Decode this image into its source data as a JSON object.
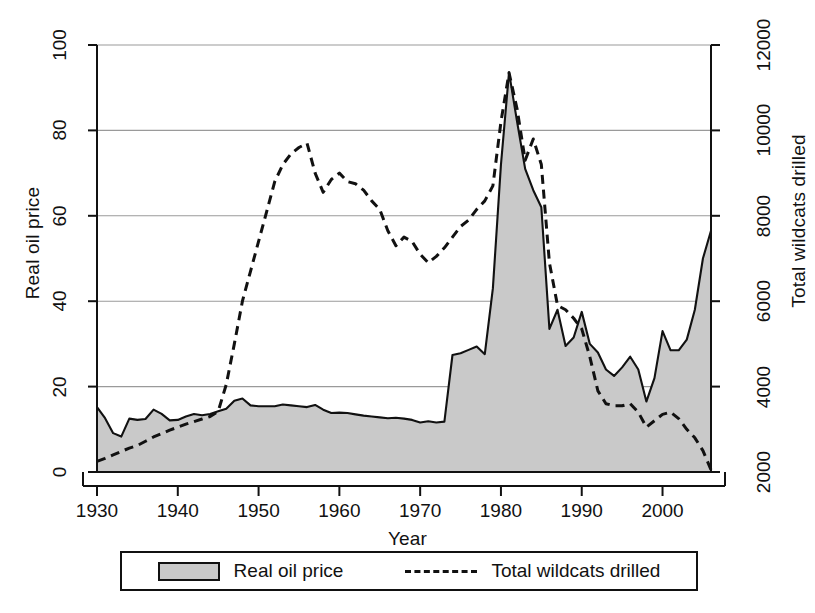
{
  "chart_data": {
    "type": "area",
    "title": "",
    "xlabel": "Year",
    "ylabel": "Real oil price",
    "ylabel_secondary": "Total wildcats drilled",
    "xlim": [
      1930,
      2006
    ],
    "ylim": [
      0,
      100
    ],
    "ylim_secondary": [
      2000,
      12000
    ],
    "xticks": [
      1930,
      1940,
      1950,
      1960,
      1970,
      1980,
      1990,
      2000
    ],
    "yticks": [
      0,
      20,
      40,
      60,
      80,
      100
    ],
    "yticks_secondary": [
      2000,
      4000,
      6000,
      8000,
      10000,
      12000
    ],
    "grid": true,
    "grid_axis": "y",
    "legend_position": "below-plot",
    "x": [
      1930,
      1931,
      1932,
      1933,
      1934,
      1935,
      1936,
      1937,
      1938,
      1939,
      1940,
      1941,
      1942,
      1943,
      1944,
      1945,
      1946,
      1947,
      1948,
      1949,
      1950,
      1951,
      1952,
      1953,
      1954,
      1955,
      1956,
      1957,
      1958,
      1959,
      1960,
      1961,
      1962,
      1963,
      1964,
      1965,
      1966,
      1967,
      1968,
      1969,
      1970,
      1971,
      1972,
      1973,
      1974,
      1975,
      1976,
      1977,
      1978,
      1979,
      1980,
      1981,
      1982,
      1983,
      1984,
      1985,
      1986,
      1987,
      1988,
      1989,
      1990,
      1991,
      1992,
      1993,
      1994,
      1995,
      1996,
      1997,
      1998,
      1999,
      2000,
      2001,
      2002,
      2003,
      2004,
      2005,
      2006
    ],
    "series": [
      {
        "name": "Real oil price",
        "axis": "left",
        "style": "filled-area",
        "fill_color": "#c9c9c9",
        "line_color": "#111111",
        "values": [
          15.2,
          12.6,
          9.1,
          8.3,
          12.5,
          12.2,
          12.4,
          14.6,
          13.6,
          12.1,
          12.2,
          13.0,
          13.6,
          13.3,
          13.6,
          14.2,
          14.8,
          16.7,
          17.2,
          15.6,
          15.4,
          15.4,
          15.4,
          15.8,
          15.6,
          15.4,
          15.2,
          15.7,
          14.6,
          13.8,
          13.9,
          13.8,
          13.5,
          13.2,
          13.0,
          12.8,
          12.6,
          12.7,
          12.5,
          12.2,
          11.6,
          11.9,
          11.6,
          11.8,
          27.4,
          27.8,
          28.6,
          29.4,
          27.6,
          43.0,
          72.0,
          93.6,
          82.0,
          71.0,
          66.0,
          62.0,
          33.5,
          38.0,
          29.5,
          31.5,
          37.5,
          30.0,
          28.0,
          24.0,
          22.5,
          24.5,
          27.0,
          24.0,
          16.5,
          22.0,
          33.0,
          28.5,
          28.5,
          31.0,
          38.0,
          50.0,
          56.5
        ]
      },
      {
        "name": "Total wildcats drilled",
        "axis": "right",
        "style": "dashed-line",
        "line_color": "#111111",
        "values": [
          2250,
          2320,
          2400,
          2480,
          2560,
          2620,
          2720,
          2820,
          2900,
          2980,
          3050,
          3120,
          3180,
          3240,
          3300,
          3420,
          4050,
          5000,
          6000,
          6700,
          7400,
          8100,
          8800,
          9200,
          9450,
          9600,
          9700,
          9000,
          8550,
          8850,
          9000,
          8800,
          8750,
          8600,
          8350,
          8150,
          7650,
          7300,
          7500,
          7400,
          7100,
          6900,
          7050,
          7250,
          7500,
          7750,
          7900,
          8150,
          8350,
          8700,
          10200,
          11350,
          10500,
          9300,
          9800,
          9200,
          6900,
          5900,
          5800,
          5600,
          5350,
          4700,
          3900,
          3600,
          3550,
          3550,
          3600,
          3400,
          3050,
          3200,
          3350,
          3400,
          3250,
          3000,
          2800,
          2500,
          2050
        ]
      }
    ]
  },
  "axes": {
    "left_title": "Real oil price",
    "right_title": "Total wildcats drilled",
    "x_title": "Year"
  },
  "legend": {
    "items": [
      {
        "label": "Real oil price",
        "marker": "gray-filled-swatch"
      },
      {
        "label": "Total wildcats drilled",
        "marker": "dashed-line"
      }
    ]
  },
  "caption": {
    "text": ""
  },
  "colors": {
    "area_fill": "#c9c9c9",
    "line": "#111111",
    "grid": "#9a9a9a",
    "background": "#ffffff"
  }
}
